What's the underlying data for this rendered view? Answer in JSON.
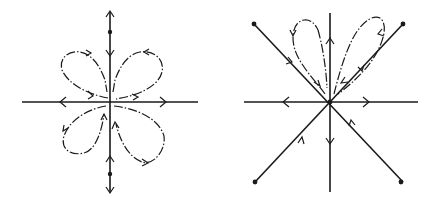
{
  "figure": {
    "background": "#ffffff",
    "ink": "#1a1a1a",
    "panels": [
      {
        "id": "left",
        "description": "Phase portrait with four-petal flower of homoclinic loops around a degenerate equilibrium at the origin",
        "center": [
          110,
          102
        ],
        "axes": {
          "horizontal": {
            "from": [
              22,
              102
            ],
            "to": [
              198,
              102
            ],
            "arrows": [
              "outward-left",
              "outward-right"
            ]
          },
          "vertical": {
            "from": [
              110,
              12
            ],
            "to": [
              110,
              192
            ]
          }
        },
        "equilibria": [
          {
            "type": "origin",
            "at": [
              110,
              102
            ]
          },
          {
            "type": "node",
            "at": [
              110,
              32
            ]
          },
          {
            "type": "node",
            "at": [
              110,
              174
            ]
          }
        ],
        "petals": [
          "upper-left",
          "upper-right",
          "lower-left",
          "lower-right"
        ]
      },
      {
        "id": "right",
        "description": "Phase portrait with separatrices along axes and diagonals, two petal loops in the upper sector",
        "center": [
          330,
          102
        ],
        "axes": {
          "horizontal": {
            "from": [
              244,
              102
            ],
            "to": [
              418,
              102
            ],
            "arrows": [
              "outward-left",
              "outward-right"
            ]
          },
          "vertical": {
            "from": [
              330,
              13
            ],
            "to": [
              330,
              192
            ],
            "arrows": [
              "up-above",
              "down-below"
            ]
          }
        },
        "diagonals": [
          {
            "end": [
              254,
              24
            ],
            "direction": "inward"
          },
          {
            "end": [
              403,
              24
            ],
            "direction": "inward"
          },
          {
            "end": [
              255,
              182
            ],
            "direction": "inward"
          },
          {
            "end": [
              401,
              182
            ],
            "direction": "inward"
          }
        ],
        "equilibria": [
          {
            "type": "origin",
            "at": [
              330,
              102
            ]
          },
          {
            "type": "node",
            "at": [
              254,
              24
            ]
          },
          {
            "type": "node",
            "at": [
              403,
              24
            ]
          },
          {
            "type": "node",
            "at": [
              255,
              182
            ]
          },
          {
            "type": "node",
            "at": [
              401,
              182
            ]
          }
        ],
        "petals": [
          "upper-left",
          "upper-right"
        ]
      }
    ]
  }
}
